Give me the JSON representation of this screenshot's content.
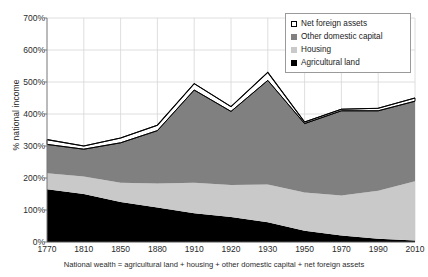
{
  "chart_data": {
    "type": "area",
    "title": "",
    "subtitle": "",
    "xlabel": "",
    "ylabel": "% national income",
    "caption": "National wealth = agricultural land + housing + other domestic capital + net foreign assets",
    "stacked": true,
    "grid": true,
    "legend_position": "top-right",
    "ylim": [
      0,
      700
    ],
    "ytick_labels": [
      "0%",
      "100%",
      "200%",
      "300%",
      "400%",
      "500%",
      "600%",
      "700%"
    ],
    "ytick_values": [
      0,
      100,
      200,
      300,
      400,
      500,
      600,
      700
    ],
    "categories": [
      "1770",
      "1810",
      "1850",
      "1880",
      "1910",
      "1920",
      "1930",
      "1950",
      "1970",
      "1990",
      "2010"
    ],
    "series": [
      {
        "name": "Agricultural land",
        "color": "#000000",
        "values": [
          165,
          150,
          125,
          108,
          90,
          78,
          62,
          35,
          20,
          10,
          5
        ]
      },
      {
        "name": "Housing",
        "color": "#c9c9c9",
        "values": [
          50,
          55,
          60,
          75,
          95,
          100,
          118,
          120,
          125,
          150,
          185
        ]
      },
      {
        "name": "Other domestic capital",
        "color": "#808080",
        "values": [
          90,
          85,
          125,
          165,
          290,
          230,
          325,
          215,
          265,
          250,
          250
        ]
      },
      {
        "name": "Net foreign assets",
        "color": "#ffffff",
        "values": [
          15,
          10,
          15,
          17,
          20,
          15,
          25,
          5,
          5,
          8,
          10
        ]
      }
    ],
    "cumulative_tops": {
      "agricultural_land": [
        165,
        150,
        125,
        108,
        90,
        78,
        62,
        35,
        20,
        10,
        5
      ],
      "housing": [
        215,
        205,
        185,
        183,
        185,
        178,
        180,
        155,
        145,
        160,
        190
      ],
      "other_domestic_capital": [
        305,
        290,
        310,
        348,
        475,
        408,
        505,
        370,
        410,
        410,
        440
      ],
      "net_foreign_assets": [
        320,
        300,
        325,
        365,
        495,
        423,
        530,
        375,
        415,
        418,
        450
      ]
    }
  },
  "legend": {
    "items": [
      {
        "label": "Net foreign assets",
        "swatch": "white-outline"
      },
      {
        "label": "Other domestic capital",
        "swatch": "dark-gray"
      },
      {
        "label": "Housing",
        "swatch": "light-gray"
      },
      {
        "label": "Agricultural land",
        "swatch": "black"
      }
    ]
  }
}
